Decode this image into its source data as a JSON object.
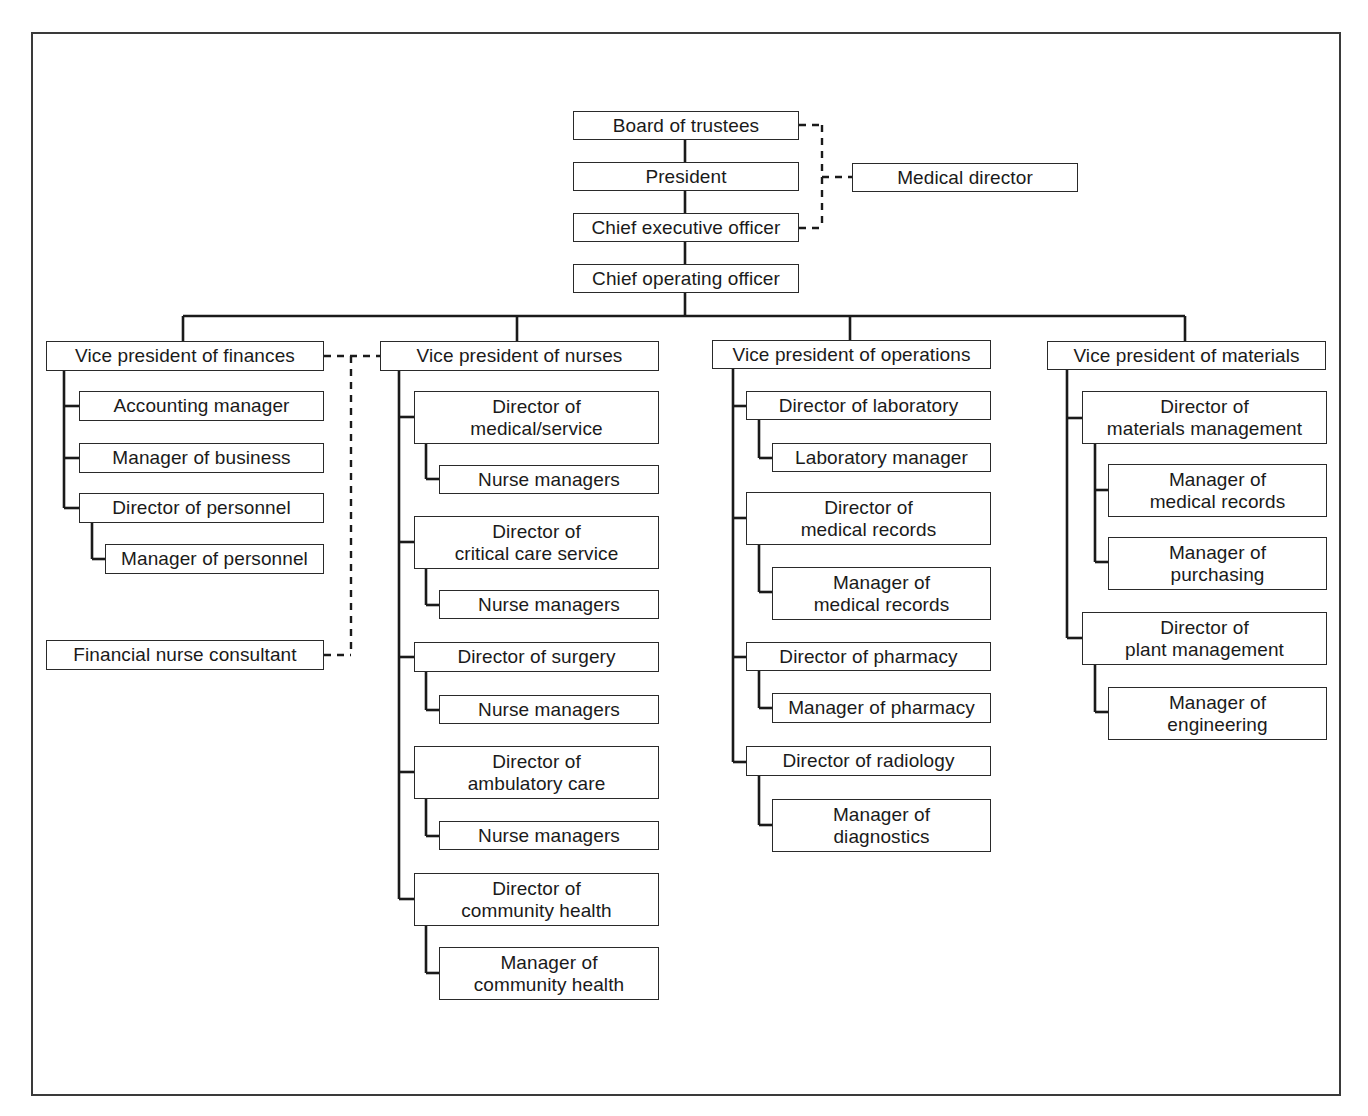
{
  "chart": {
    "type": "organizational-chart",
    "top_chain": {
      "board": "Board of trustees",
      "president": "President",
      "ceo": "Chief executive officer",
      "coo": "Chief operating officer",
      "medical_director": "Medical director"
    },
    "finances": {
      "vp": "Vice president of finances",
      "accounting": "Accounting manager",
      "business": "Manager of business",
      "dir_personnel": "Director of personnel",
      "mgr_personnel": "Manager of personnel",
      "consultant": "Financial nurse consultant"
    },
    "nurses": {
      "vp": "Vice president of nurses",
      "dir_medical": "Director of\nmedical/service",
      "nm1": "Nurse managers",
      "dir_critical": "Director of\ncritical care service",
      "nm2": "Nurse managers",
      "dir_surgery": "Director of surgery",
      "nm3": "Nurse managers",
      "dir_ambulatory": "Director of\nambulatory care",
      "nm4": "Nurse managers",
      "dir_community": "Director of\ncommunity health",
      "mgr_community": "Manager of\ncommunity health"
    },
    "operations": {
      "vp": "Vice president of operations",
      "dir_lab": "Director of laboratory",
      "mgr_lab": "Laboratory manager",
      "dir_records": "Director of\nmedical records",
      "mgr_records": "Manager of\nmedical records",
      "dir_pharmacy": "Director of pharmacy",
      "mgr_pharmacy": "Manager of pharmacy",
      "dir_radiology": "Director of radiology",
      "mgr_diagnostics": "Manager of\ndiagnostics"
    },
    "materials": {
      "vp": "Vice president of materials",
      "dir_materials": "Director of\nmaterials management",
      "mgr_records": "Manager of\nmedical records",
      "mgr_purchasing": "Manager of\npurchasing",
      "dir_plant": "Director of\nplant management",
      "mgr_engineering": "Manager of\nengineering"
    },
    "line_styles": {
      "solid": "direct reporting",
      "dashed": "advisory / staff relationship"
    },
    "colors": {
      "line": "#1a1a1a",
      "box_border": "#2a2a2a",
      "background": "#ffffff"
    }
  }
}
